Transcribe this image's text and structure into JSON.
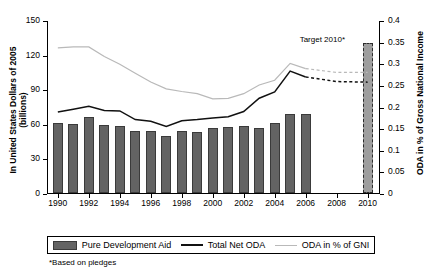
{
  "chart_data": {
    "type": "bar",
    "title": "",
    "xlabel": "",
    "ylabel": "In United States Dollars of 2005 (billions)",
    "y2label": "ODA in % of Gross National Income",
    "grid": false,
    "legend_position": "bottom",
    "x": [
      1990,
      1991,
      1992,
      1993,
      1994,
      1995,
      1996,
      1997,
      1998,
      1999,
      2000,
      2001,
      2002,
      2003,
      2004,
      2005,
      2006
    ],
    "xticks": [
      "1990",
      "1992",
      "1994",
      "1996",
      "1998",
      "2000",
      "2002",
      "2004",
      "2006",
      "2008",
      "2010"
    ],
    "xlim": [
      1989.3,
      2010.8
    ],
    "ylim": [
      0,
      150
    ],
    "yticks": [
      "0",
      "30",
      "60",
      "90",
      "120",
      "150"
    ],
    "y2lim": [
      0,
      0.4
    ],
    "y2ticks": [
      "0",
      "0.05",
      "0.1",
      "0.15",
      "0.2",
      "0.25",
      "0.3",
      "0.35",
      "0.4"
    ],
    "series": [
      {
        "name": "Pure Development Aid",
        "type": "bar",
        "axis": "left",
        "color": "#636363",
        "values": [
          61.5,
          60.5,
          66.5,
          59.5,
          59.0,
          54.5,
          54.5,
          50.5,
          55.0,
          54.0,
          57.5,
          58.0,
          59.0,
          57.5,
          62.0,
          69.0,
          69.5
        ]
      },
      {
        "name": "Total Net ODA",
        "type": "line",
        "axis": "left",
        "color": "#111111",
        "values": [
          71.0,
          73.5,
          76.0,
          72.5,
          72.0,
          64.5,
          63.0,
          58.5,
          63.5,
          64.5,
          66.0,
          67.0,
          71.5,
          83.0,
          88.5,
          106.5,
          101.5
        ],
        "projection": {
          "x": [
            2006,
            2008,
            2010
          ],
          "values": [
            101.5,
            97.5,
            97.0
          ],
          "style": "dashed"
        }
      },
      {
        "name": "ODA in % of GNI",
        "type": "line",
        "axis": "right",
        "color": "#b9b9b9",
        "values": [
          0.338,
          0.34,
          0.34,
          0.318,
          0.3,
          0.279,
          0.259,
          0.243,
          0.237,
          0.232,
          0.22,
          0.221,
          0.232,
          0.252,
          0.263,
          0.302,
          0.29
        ],
        "projection": {
          "x": [
            2006,
            2008,
            2010
          ],
          "values": [
            0.29,
            0.281,
            0.281
          ],
          "style": "dashed"
        }
      },
      {
        "name": "Target 2010",
        "type": "bar",
        "axis": "right",
        "color": "#9e9e9e",
        "x": 2010,
        "value": 0.35
      }
    ],
    "annotations": [
      {
        "text": "Target 2010*",
        "x": 2009.1,
        "y2": 0.355
      }
    ],
    "footnote": "*Based on pledges",
    "legend": [
      {
        "label": "Pure Development Aid",
        "marker": "bar",
        "color": "#636363"
      },
      {
        "label": "Total Net ODA",
        "marker": "line",
        "color": "#111111"
      },
      {
        "label": "ODA in % of GNI",
        "marker": "line",
        "color": "#b9b9b9"
      }
    ]
  }
}
